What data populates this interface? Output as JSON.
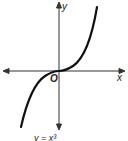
{
  "diagram": {
    "axes": {
      "x_label": "x",
      "y_label": "y",
      "origin_label": "O"
    },
    "caption": "y = x³",
    "colors": {
      "ink": "#1a1a1a",
      "background": "#ffffff"
    }
  }
}
